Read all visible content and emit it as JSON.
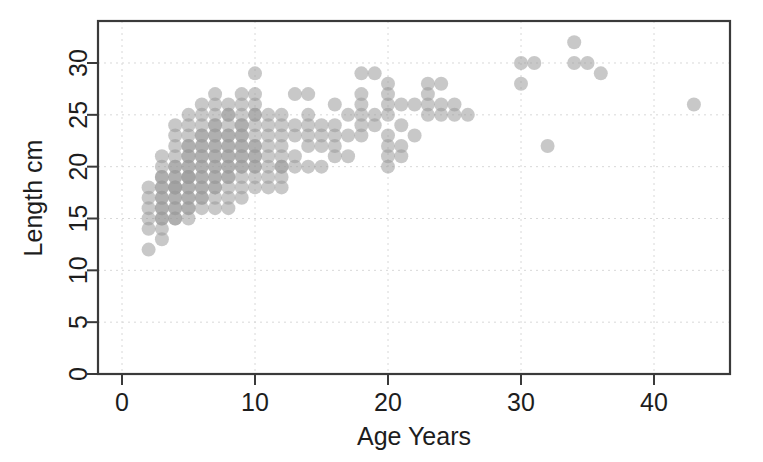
{
  "chart_data": {
    "type": "scatter",
    "title": "",
    "xlabel": "Age Years",
    "ylabel": "Length cm",
    "xlim": [
      -1.5,
      46
    ],
    "ylim": [
      0,
      33.5
    ],
    "xticks": [
      0,
      10,
      20,
      30,
      40
    ],
    "xtick_labels": [
      "0",
      "10",
      "20",
      "30",
      "40"
    ],
    "yticks": [
      0,
      5,
      10,
      15,
      20,
      25,
      30
    ],
    "ytick_labels": [
      "0",
      "5",
      "10",
      "15",
      "20",
      "25",
      "30"
    ],
    "grid": true,
    "grid_axes": "both",
    "legend": "none",
    "marker": {
      "shape": "circle",
      "color": "#9b9b9b",
      "opacity": 0.55,
      "radius_px": 7
    },
    "n_points": 236,
    "points": [
      [
        2,
        12
      ],
      [
        2,
        14
      ],
      [
        2,
        15
      ],
      [
        2,
        16
      ],
      [
        2,
        17
      ],
      [
        2,
        18
      ],
      [
        3,
        13
      ],
      [
        3,
        14
      ],
      [
        3,
        15
      ],
      [
        3,
        15
      ],
      [
        3,
        16
      ],
      [
        3,
        16
      ],
      [
        3,
        17
      ],
      [
        3,
        17
      ],
      [
        3,
        18
      ],
      [
        3,
        18
      ],
      [
        3,
        19
      ],
      [
        3,
        19
      ],
      [
        3,
        20
      ],
      [
        3,
        21
      ],
      [
        4,
        15
      ],
      [
        4,
        15
      ],
      [
        4,
        16
      ],
      [
        4,
        16
      ],
      [
        4,
        17
      ],
      [
        4,
        17
      ],
      [
        4,
        18
      ],
      [
        4,
        18
      ],
      [
        4,
        18
      ],
      [
        4,
        19
      ],
      [
        4,
        19
      ],
      [
        4,
        20
      ],
      [
        4,
        20
      ],
      [
        4,
        21
      ],
      [
        4,
        22
      ],
      [
        4,
        23
      ],
      [
        4,
        24
      ],
      [
        5,
        15
      ],
      [
        5,
        16
      ],
      [
        5,
        16
      ],
      [
        5,
        17
      ],
      [
        5,
        17
      ],
      [
        5,
        18
      ],
      [
        5,
        18
      ],
      [
        5,
        19
      ],
      [
        5,
        19
      ],
      [
        5,
        19
      ],
      [
        5,
        20
      ],
      [
        5,
        20
      ],
      [
        5,
        21
      ],
      [
        5,
        21
      ],
      [
        5,
        22
      ],
      [
        5,
        22
      ],
      [
        5,
        23
      ],
      [
        5,
        24
      ],
      [
        5,
        25
      ],
      [
        6,
        16
      ],
      [
        6,
        17
      ],
      [
        6,
        17
      ],
      [
        6,
        18
      ],
      [
        6,
        18
      ],
      [
        6,
        19
      ],
      [
        6,
        19
      ],
      [
        6,
        20
      ],
      [
        6,
        20
      ],
      [
        6,
        21
      ],
      [
        6,
        21
      ],
      [
        6,
        22
      ],
      [
        6,
        22
      ],
      [
        6,
        23
      ],
      [
        6,
        23
      ],
      [
        6,
        24
      ],
      [
        6,
        25
      ],
      [
        6,
        26
      ],
      [
        7,
        16
      ],
      [
        7,
        17
      ],
      [
        7,
        18
      ],
      [
        7,
        18
      ],
      [
        7,
        19
      ],
      [
        7,
        19
      ],
      [
        7,
        20
      ],
      [
        7,
        20
      ],
      [
        7,
        21
      ],
      [
        7,
        21
      ],
      [
        7,
        22
      ],
      [
        7,
        22
      ],
      [
        7,
        23
      ],
      [
        7,
        23
      ],
      [
        7,
        24
      ],
      [
        7,
        24
      ],
      [
        7,
        25
      ],
      [
        7,
        26
      ],
      [
        7,
        27
      ],
      [
        8,
        16
      ],
      [
        8,
        17
      ],
      [
        8,
        18
      ],
      [
        8,
        19
      ],
      [
        8,
        19
      ],
      [
        8,
        20
      ],
      [
        8,
        20
      ],
      [
        8,
        21
      ],
      [
        8,
        21
      ],
      [
        8,
        22
      ],
      [
        8,
        22
      ],
      [
        8,
        23
      ],
      [
        8,
        23
      ],
      [
        8,
        24
      ],
      [
        8,
        25
      ],
      [
        8,
        25
      ],
      [
        8,
        26
      ],
      [
        9,
        17
      ],
      [
        9,
        18
      ],
      [
        9,
        19
      ],
      [
        9,
        20
      ],
      [
        9,
        20
      ],
      [
        9,
        21
      ],
      [
        9,
        21
      ],
      [
        9,
        22
      ],
      [
        9,
        22
      ],
      [
        9,
        23
      ],
      [
        9,
        23
      ],
      [
        9,
        24
      ],
      [
        9,
        24
      ],
      [
        9,
        25
      ],
      [
        9,
        26
      ],
      [
        9,
        27
      ],
      [
        10,
        18
      ],
      [
        10,
        19
      ],
      [
        10,
        20
      ],
      [
        10,
        20
      ],
      [
        10,
        21
      ],
      [
        10,
        21
      ],
      [
        10,
        22
      ],
      [
        10,
        22
      ],
      [
        10,
        23
      ],
      [
        10,
        24
      ],
      [
        10,
        25
      ],
      [
        10,
        25
      ],
      [
        10,
        26
      ],
      [
        10,
        27
      ],
      [
        10,
        29
      ],
      [
        11,
        18
      ],
      [
        11,
        19
      ],
      [
        11,
        20
      ],
      [
        11,
        21
      ],
      [
        11,
        22
      ],
      [
        11,
        23
      ],
      [
        11,
        24
      ],
      [
        11,
        25
      ],
      [
        12,
        18
      ],
      [
        12,
        19
      ],
      [
        12,
        20
      ],
      [
        12,
        20
      ],
      [
        12,
        21
      ],
      [
        12,
        22
      ],
      [
        12,
        23
      ],
      [
        12,
        24
      ],
      [
        12,
        25
      ],
      [
        13,
        20
      ],
      [
        13,
        21
      ],
      [
        13,
        23
      ],
      [
        13,
        24
      ],
      [
        13,
        27
      ],
      [
        14,
        20
      ],
      [
        14,
        22
      ],
      [
        14,
        23
      ],
      [
        14,
        24
      ],
      [
        14,
        25
      ],
      [
        14,
        27
      ],
      [
        15,
        20
      ],
      [
        15,
        22
      ],
      [
        15,
        23
      ],
      [
        15,
        24
      ],
      [
        16,
        21
      ],
      [
        16,
        22
      ],
      [
        16,
        23
      ],
      [
        16,
        24
      ],
      [
        16,
        26
      ],
      [
        17,
        21
      ],
      [
        17,
        23
      ],
      [
        17,
        25
      ],
      [
        18,
        23
      ],
      [
        18,
        24
      ],
      [
        18,
        25
      ],
      [
        18,
        26
      ],
      [
        18,
        27
      ],
      [
        18,
        29
      ],
      [
        19,
        24
      ],
      [
        19,
        25
      ],
      [
        19,
        29
      ],
      [
        20,
        20
      ],
      [
        20,
        21
      ],
      [
        20,
        22
      ],
      [
        20,
        23
      ],
      [
        20,
        25
      ],
      [
        20,
        26
      ],
      [
        20,
        27
      ],
      [
        20,
        28
      ],
      [
        21,
        21
      ],
      [
        21,
        22
      ],
      [
        21,
        24
      ],
      [
        21,
        26
      ],
      [
        22,
        23
      ],
      [
        22,
        26
      ],
      [
        23,
        25
      ],
      [
        23,
        26
      ],
      [
        23,
        27
      ],
      [
        23,
        28
      ],
      [
        24,
        25
      ],
      [
        24,
        26
      ],
      [
        24,
        28
      ],
      [
        25,
        25
      ],
      [
        25,
        26
      ],
      [
        26,
        25
      ],
      [
        30,
        28
      ],
      [
        30,
        30
      ],
      [
        31,
        30
      ],
      [
        32,
        22
      ],
      [
        34,
        30
      ],
      [
        34,
        32
      ],
      [
        35,
        30
      ],
      [
        36,
        29
      ],
      [
        43,
        26
      ]
    ]
  },
  "axes": {
    "x_label": "Age Years",
    "y_label": "Length cm"
  }
}
